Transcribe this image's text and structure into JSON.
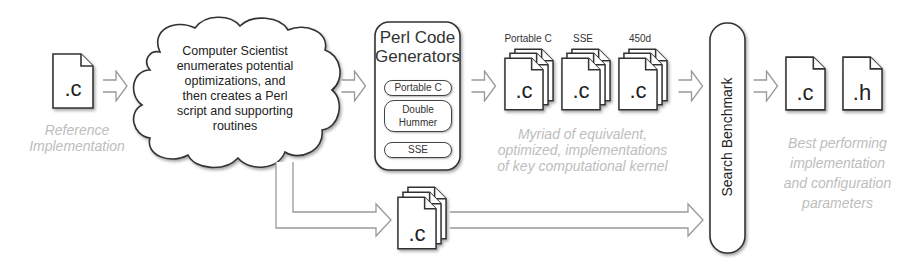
{
  "reference": {
    "file_ext": ".c",
    "caption_line1": "Reference",
    "caption_line2": "Implementation"
  },
  "cloud": {
    "lines": [
      "Computer Scientist",
      "enumerates potential",
      "optimizations, and",
      "then creates a Perl",
      "script and supporting",
      "routines"
    ]
  },
  "generators": {
    "title_line1": "Perl Code",
    "title_line2": "Generators",
    "items": [
      {
        "label": "Portable C"
      },
      {
        "label_line1": "Double",
        "label_line2": "Hummer"
      },
      {
        "label": "SSE"
      }
    ]
  },
  "implementations": {
    "stacks": [
      {
        "label": "Portable C",
        "file_ext": ".c"
      },
      {
        "label": "SSE",
        "file_ext": ".c"
      },
      {
        "label": "450d",
        "file_ext": ".c"
      }
    ],
    "caption_lines": [
      "Myriad of equivalent,",
      "optimized, implementations",
      "of key computational kernel"
    ]
  },
  "support_files": {
    "file_ext": ".c"
  },
  "benchmark": {
    "label": "Search Benchmark"
  },
  "output": {
    "files": [
      {
        "file_ext": ".c"
      },
      {
        "file_ext": ".h"
      }
    ],
    "caption_lines": [
      "Best performing",
      "implementation",
      "and configuration",
      "parameters"
    ]
  }
}
